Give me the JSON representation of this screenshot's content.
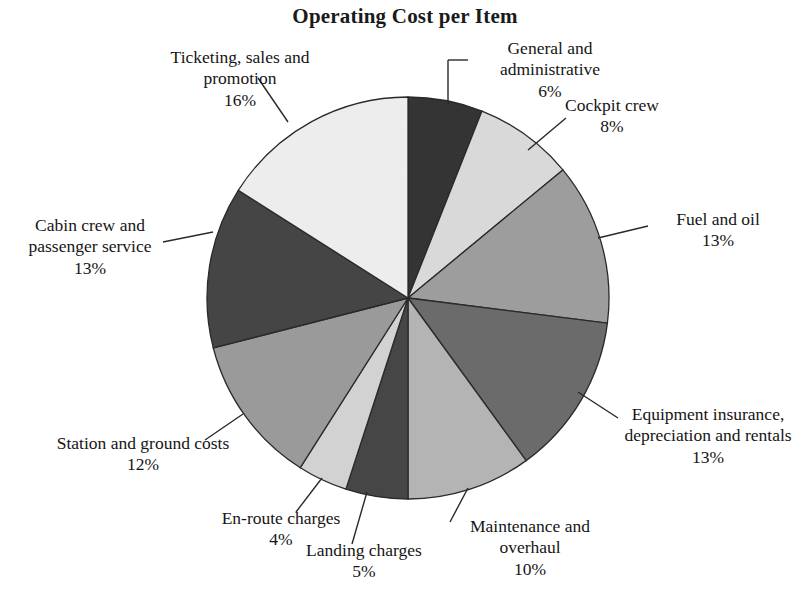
{
  "chart_data": {
    "type": "pie",
    "title": "Operating Cost per Item",
    "xlabel": "",
    "ylabel": "",
    "units": "percent",
    "legend": "none (direct labels with leader lines)",
    "grid": false,
    "start_angle_deg": 0,
    "direction": "clockwise",
    "categories": [
      "General and administrative",
      "Cockpit crew",
      "Fuel and oil",
      "Equipment insurance, depreciation and rentals",
      "Maintenance and overhaul",
      "Landing charges",
      "En-route charges",
      "Station and ground costs",
      "Cabin crew and passenger service",
      "Ticketing, sales and promotion"
    ],
    "values": [
      6,
      8,
      13,
      13,
      10,
      5,
      4,
      12,
      13,
      16
    ],
    "value_labels": [
      "6%",
      "8%",
      "13%",
      "13%",
      "10%",
      "5%",
      "4%",
      "12%",
      "13%",
      "16%"
    ],
    "colors": [
      "#343434",
      "#d9d9d9",
      "#9d9d9d",
      "#6b6b6b",
      "#b4b4b4",
      "#464646",
      "#d2d2d2",
      "#9a9a9a",
      "#454545",
      "#ededed"
    ],
    "slice_outline": "#2a2a2a"
  },
  "labels": [
    {
      "id": "general-and-administrative",
      "name_lines": [
        "General and",
        "administrative"
      ],
      "percent": "6%"
    },
    {
      "id": "cockpit-crew",
      "name_lines": [
        "Cockpit crew"
      ],
      "percent": "8%"
    },
    {
      "id": "fuel-and-oil",
      "name_lines": [
        "Fuel and oil"
      ],
      "percent": "13%"
    },
    {
      "id": "equipment-insurance",
      "name_lines": [
        "Equipment insurance,",
        "depreciation and rentals"
      ],
      "percent": "13%"
    },
    {
      "id": "maintenance-and-overhaul",
      "name_lines": [
        "Maintenance and",
        "overhaul"
      ],
      "percent": "10%"
    },
    {
      "id": "landing-charges",
      "name_lines": [
        "Landing charges"
      ],
      "percent": "5%"
    },
    {
      "id": "en-route-charges",
      "name_lines": [
        "En-route charges"
      ],
      "percent": "4%"
    },
    {
      "id": "station-and-ground-costs",
      "name_lines": [
        "Station and ground costs"
      ],
      "percent": "12%"
    },
    {
      "id": "cabin-crew-and-passenger-service",
      "name_lines": [
        "Cabin crew and",
        "passenger service"
      ],
      "percent": "13%"
    },
    {
      "id": "ticketing-sales-and-promotion",
      "name_lines": [
        "Ticketing, sales and",
        "promotion"
      ],
      "percent": "16%"
    }
  ],
  "label_text": {
    "general_l1": "General and",
    "general_l2": "administrative",
    "general_pct": "6%",
    "cockpit_l1": "Cockpit crew",
    "cockpit_pct": "8%",
    "fuel_l1": "Fuel and oil",
    "fuel_pct": "13%",
    "equip_l1": "Equipment insurance,",
    "equip_l2": "depreciation and rentals",
    "equip_pct": "13%",
    "maint_l1": "Maintenance and",
    "maint_l2": "overhaul",
    "maint_pct": "10%",
    "landing_l1": "Landing charges",
    "landing_pct": "5%",
    "enroute_l1": "En-route charges",
    "enroute_pct": "4%",
    "station_l1": "Station and ground costs",
    "station_pct": "12%",
    "cabin_l1": "Cabin crew and",
    "cabin_l2": "passenger service",
    "cabin_pct": "13%",
    "ticketing_l1": "Ticketing, sales and",
    "ticketing_l2": "promotion",
    "ticketing_pct": "16%"
  }
}
